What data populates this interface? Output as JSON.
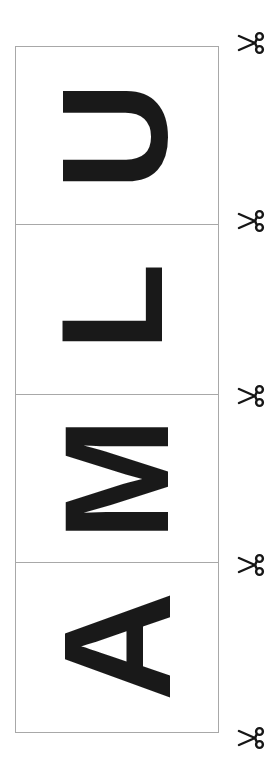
{
  "page": {
    "background_color": "#ffffff",
    "sheet_border_color": "#a8a8a8",
    "ink_color": "#191919",
    "width": 277,
    "height": 780
  },
  "sheet": {
    "word": "ULMA",
    "orientation": "letters rotated 90 degrees counter-clockwise",
    "panels": [
      {
        "letter": "U",
        "index": 1
      },
      {
        "letter": "L",
        "index": 2
      },
      {
        "letter": "M",
        "index": 3
      },
      {
        "letter": "A",
        "index": 4
      }
    ]
  },
  "cut_marks": {
    "icon": "scissors-icon",
    "count": 5,
    "items": [
      {
        "id": 0
      },
      {
        "id": 1
      },
      {
        "id": 2
      },
      {
        "id": 3
      },
      {
        "id": 4
      }
    ]
  }
}
